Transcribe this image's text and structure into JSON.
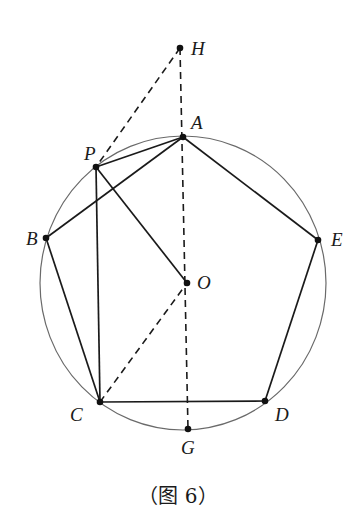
{
  "figure": {
    "caption": "（图 6）",
    "circle": {
      "cx": 183,
      "cy": 283,
      "rx": 143,
      "ry": 147,
      "color": "#6a6a6a"
    },
    "points": {
      "H": {
        "label": "H",
        "x": 180,
        "y": 48
      },
      "A": {
        "label": "A",
        "x": 183,
        "y": 137
      },
      "P": {
        "label": "P",
        "x": 96,
        "y": 167
      },
      "B": {
        "label": "B",
        "x": 46,
        "y": 238
      },
      "E": {
        "label": "E",
        "x": 318,
        "y": 240
      },
      "O": {
        "label": "O",
        "x": 187,
        "y": 283
      },
      "C": {
        "label": "C",
        "x": 100,
        "y": 402
      },
      "D": {
        "label": "D",
        "x": 265,
        "y": 401
      },
      "G": {
        "label": "G",
        "x": 188,
        "y": 429
      }
    },
    "solid_segments": [
      [
        "A",
        "B"
      ],
      [
        "B",
        "C"
      ],
      [
        "C",
        "D"
      ],
      [
        "D",
        "E"
      ],
      [
        "E",
        "A"
      ],
      [
        "P",
        "A"
      ],
      [
        "P",
        "C"
      ],
      [
        "P",
        "O"
      ]
    ],
    "dashed_segments": [
      [
        "H",
        "P"
      ],
      [
        "H",
        "G"
      ],
      [
        "C",
        "O"
      ]
    ],
    "line_color": "#1a1a1a"
  }
}
